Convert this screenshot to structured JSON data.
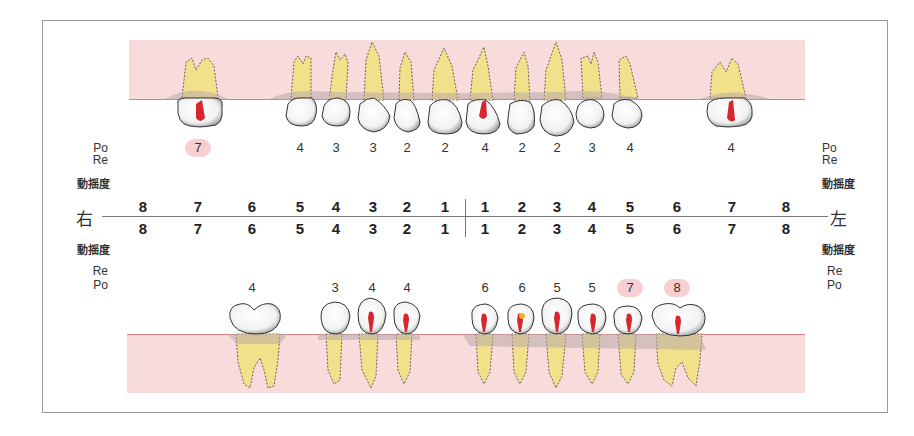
{
  "labels": {
    "upper_po": "Po",
    "upper_re": "Re",
    "mobility": "動揺度",
    "lower_re": "Re",
    "lower_po": "Po",
    "right_side": "右",
    "left_side": "左"
  },
  "tooth_numbers": {
    "right": [
      "8",
      "7",
      "6",
      "5",
      "4",
      "3",
      "2",
      "1"
    ],
    "left": [
      "1",
      "2",
      "3",
      "4",
      "5",
      "6",
      "7",
      "8"
    ]
  },
  "upper_pocket_values": [
    {
      "tooth": "R7",
      "value": "7",
      "highlight": true
    },
    {
      "tooth": "R5",
      "value": "4",
      "highlight": false
    },
    {
      "tooth": "R4",
      "value": "3",
      "highlight": false
    },
    {
      "tooth": "R3",
      "value": "3",
      "highlight": false
    },
    {
      "tooth": "R2",
      "value": "2",
      "highlight": false
    },
    {
      "tooth": "R1",
      "value": "2",
      "highlight": false
    },
    {
      "tooth": "L1",
      "value": "4",
      "highlight": false
    },
    {
      "tooth": "L2",
      "value": "2",
      "highlight": false
    },
    {
      "tooth": "L3",
      "value": "2",
      "highlight": false
    },
    {
      "tooth": "L4",
      "value": "3",
      "highlight": false
    },
    {
      "tooth": "L5",
      "value": "4",
      "highlight": false
    },
    {
      "tooth": "L7",
      "value": "4",
      "highlight": false
    }
  ],
  "lower_pocket_values": [
    {
      "tooth": "R6",
      "value": "4",
      "highlight": false
    },
    {
      "tooth": "R4",
      "value": "3",
      "highlight": false
    },
    {
      "tooth": "R3",
      "value": "4",
      "highlight": false
    },
    {
      "tooth": "R2",
      "value": "4",
      "highlight": false
    },
    {
      "tooth": "L1",
      "value": "6",
      "highlight": false
    },
    {
      "tooth": "L2",
      "value": "6",
      "highlight": false
    },
    {
      "tooth": "L3",
      "value": "5",
      "highlight": false
    },
    {
      "tooth": "L4",
      "value": "5",
      "highlight": false
    },
    {
      "tooth": "L5",
      "value": "7",
      "highlight": true
    },
    {
      "tooth": "L6",
      "value": "8",
      "highlight": true
    }
  ],
  "colors": {
    "gum": "#f8dcdc",
    "gumline": "#e07d88",
    "root": "#f3e08a",
    "highlight": "#f6cfd2",
    "pulp": "#d8262e"
  }
}
